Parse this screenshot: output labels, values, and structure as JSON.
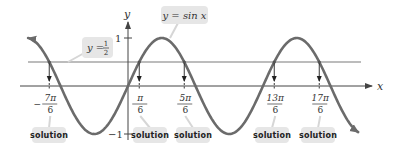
{
  "diagram": {
    "axes": {
      "x_label": "x",
      "y_label": "y",
      "y_ticks": [
        {
          "label": "1",
          "value": 1
        },
        {
          "label": "−1",
          "value": -1
        }
      ]
    },
    "curve": {
      "label": "y = sin x",
      "function": "sin",
      "x_start_pi": -1.48,
      "x_end_pi": 3.41,
      "color": "#6b6b6b"
    },
    "line": {
      "label_lhs": "y =",
      "label_num": "1",
      "label_den": "2",
      "value": 0.5,
      "color": "#7a7a7a"
    },
    "solutions": [
      {
        "sign": "−",
        "num": "7π",
        "den": "6",
        "value_pi": -1.1666667,
        "label": "solution"
      },
      {
        "sign": "",
        "num": "π",
        "den": "6",
        "value_pi": 0.1666667,
        "label": "solution"
      },
      {
        "sign": "",
        "num": "5π",
        "den": "6",
        "value_pi": 0.8333333,
        "label": "solution"
      },
      {
        "sign": "",
        "num": "13π",
        "den": "6",
        "value_pi": 2.1666667,
        "label": "solution"
      },
      {
        "sign": "",
        "num": "17π",
        "den": "6",
        "value_pi": 2.8333333,
        "label": "solution"
      }
    ],
    "colors": {
      "axis": "#444444",
      "label_box": "#e6e6e6",
      "leader": "#d6d6d6"
    }
  }
}
